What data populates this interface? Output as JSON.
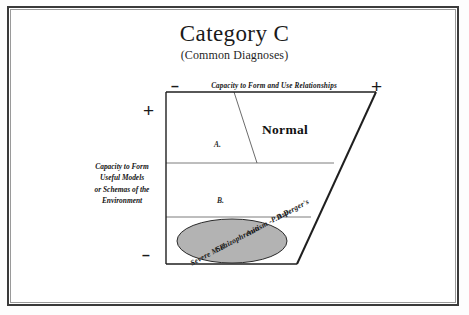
{
  "document": {
    "title": "Category C",
    "subtitle": "(Common Diagnoses)"
  },
  "axes": {
    "x_label": "Capacity to Form and Use Relationships",
    "x_minus": "–",
    "x_plus": "+",
    "y_label_lines": [
      "Capacity to Form",
      "Useful Models",
      "or Schemas of the",
      "Environment"
    ],
    "y_label": "Capacity to Form Useful Models or Schemas of the Environment",
    "y_plus": "+",
    "y_minus": "–"
  },
  "diagram": {
    "type": "trapezoid-quadrant",
    "zones": [
      {
        "id": "a",
        "label": "A."
      },
      {
        "id": "b",
        "label": "B."
      }
    ],
    "normal_region_label": "Normal",
    "diagnoses_ellipse": {
      "fill_color": "#b3b3b3",
      "stroke_color": "#2a2a2a",
      "rotation_deg": -28,
      "items": [
        "Severe M.R.",
        "Schizophrenia",
        "Autism -P.D.D.",
        "Asperger's"
      ]
    }
  },
  "colors": {
    "frame": "#3a3a3a",
    "outline": "#1f1f1f",
    "divider": "#6e6e6e",
    "ellipse_fill": "#b3b3b3",
    "page": "#ffffff"
  }
}
